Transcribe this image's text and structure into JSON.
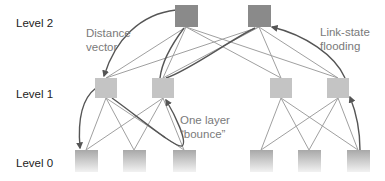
{
  "labels": {
    "level2": "Level 2",
    "level1": "Level 1",
    "level0": "Level 0"
  },
  "annotations": {
    "distance_vector_line1": "Distance",
    "distance_vector_line2": "vector",
    "link_state_line1": "Link-state",
    "link_state_line2": "flooding",
    "bounce_line1": "One layer",
    "bounce_line2": "“bounce”"
  },
  "colors": {
    "level2_node": "#8a8a8a",
    "level1_node": "#c4c4c4",
    "level0_node_top": "#a8a8a8",
    "level0_node_bottom": "#f0f0f0",
    "edge": "#a0a0a0",
    "arrow": "#555555",
    "annotation_text": "#7a7a7a"
  },
  "nodes": {
    "level2": [
      {
        "id": "L2-1",
        "x": 175,
        "y": 5,
        "w": 23,
        "h": 22
      },
      {
        "id": "L2-2",
        "x": 248,
        "y": 5,
        "w": 23,
        "h": 22
      }
    ],
    "level1": [
      {
        "id": "L1-1",
        "x": 95,
        "y": 78,
        "w": 22,
        "h": 20
      },
      {
        "id": "L1-2",
        "x": 152,
        "y": 78,
        "w": 22,
        "h": 20
      },
      {
        "id": "L1-3",
        "x": 270,
        "y": 78,
        "w": 22,
        "h": 20
      },
      {
        "id": "L1-4",
        "x": 327,
        "y": 78,
        "w": 22,
        "h": 20
      }
    ],
    "level0": [
      {
        "id": "L0-1",
        "x": 75,
        "y": 150,
        "w": 23,
        "h": 22
      },
      {
        "id": "L0-2",
        "x": 123,
        "y": 150,
        "w": 23,
        "h": 22
      },
      {
        "id": "L0-3",
        "x": 173,
        "y": 150,
        "w": 23,
        "h": 22
      },
      {
        "id": "L0-4",
        "x": 250,
        "y": 150,
        "w": 23,
        "h": 22
      },
      {
        "id": "L0-5",
        "x": 298,
        "y": 150,
        "w": 23,
        "h": 22
      },
      {
        "id": "L0-6",
        "x": 347,
        "y": 150,
        "w": 23,
        "h": 22
      }
    ]
  }
}
